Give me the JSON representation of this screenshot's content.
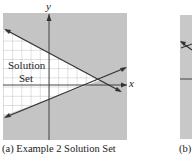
{
  "figures": [
    {
      "id": "a",
      "caption": "(a) Example 2 Solution Set",
      "region_label_line1": "Solution",
      "region_label_line2": "Set",
      "x_axis_label": "x",
      "y_axis_label": "y",
      "colors": {
        "shaded": "#c4c4c4",
        "solution_region": "#ffffff",
        "grid": "#9a9a9a",
        "lines": "#333333"
      }
    },
    {
      "id": "b",
      "caption": "(b)",
      "colors": {
        "shaded": "#c8c8c8",
        "lines": "#333333"
      }
    }
  ]
}
